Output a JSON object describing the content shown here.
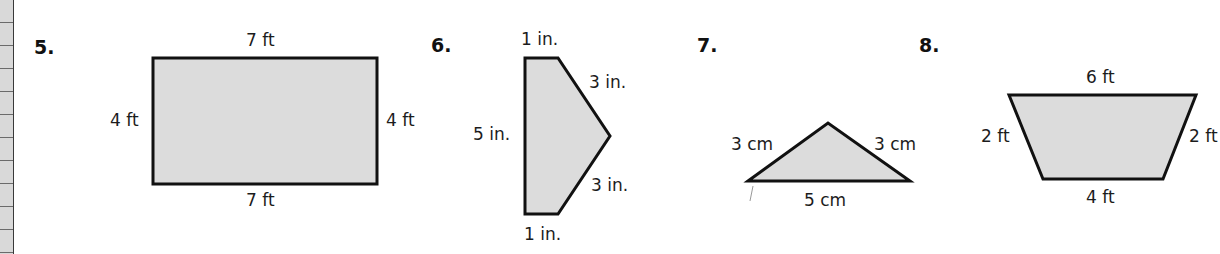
{
  "worksheet": {
    "problems": [
      {
        "number": "5.",
        "shape": "rectangle",
        "labels": {
          "top": "7 ft",
          "bottom": "7 ft",
          "left": "4 ft",
          "right": "4 ft"
        }
      },
      {
        "number": "6.",
        "shape": "pentagon",
        "labels": {
          "top": "1 in.",
          "upper_right": "3 in.",
          "left": "5 in.",
          "lower_right": "3 in.",
          "bottom": "1 in."
        }
      },
      {
        "number": "7.",
        "shape": "triangle",
        "labels": {
          "left": "3 cm",
          "right": "3 cm",
          "bottom": "5 cm"
        }
      },
      {
        "number": "8.",
        "shape": "trapezoid",
        "labels": {
          "top": "6 ft",
          "left": "2 ft",
          "right": "2 ft",
          "bottom": "4 ft"
        }
      }
    ],
    "colors": {
      "fill": "#dcdcdc",
      "stroke": "#111111"
    }
  }
}
